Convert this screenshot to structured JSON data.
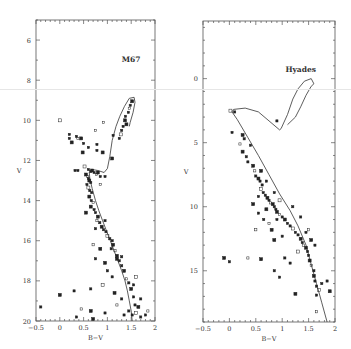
{
  "figure": {
    "panels": [
      "M67",
      "Hyades"
    ]
  },
  "chart_data": [
    {
      "type": "scatter",
      "title": "M67",
      "xlabel": "B−V",
      "ylabel": "V",
      "xlim": [
        -0.5,
        2
      ],
      "ylim": [
        20,
        5
      ],
      "y_inverted": true,
      "grid": false,
      "legend": null,
      "frame": {
        "x0": 36,
        "x1": 155,
        "y0": 20,
        "y1": 321
      },
      "xticks": [
        -0.5,
        0,
        0.5,
        1,
        1.5,
        2
      ],
      "xtick_labels": [
        "−0.5",
        "0",
        "0.5",
        "1",
        "1.5",
        "2"
      ],
      "yticks": [
        6,
        8,
        10,
        12,
        14,
        16,
        18,
        20
      ],
      "ytick_labels": [
        "6",
        "8",
        "10",
        "12",
        "14",
        "16",
        "18",
        "20"
      ],
      "annotation": {
        "text": "M67",
        "x": 1.5,
        "y": 7.1
      },
      "isochrone": [
        [
          1.52,
          20.0
        ],
        [
          1.5,
          19.5
        ],
        [
          1.46,
          19.0
        ],
        [
          1.42,
          18.5
        ],
        [
          1.37,
          18.0
        ],
        [
          1.3,
          17.5
        ],
        [
          1.22,
          17.0
        ],
        [
          1.14,
          16.5
        ],
        [
          1.06,
          16.0
        ],
        [
          0.98,
          15.5
        ],
        [
          0.9,
          15.0
        ],
        [
          0.82,
          14.5
        ],
        [
          0.75,
          14.0
        ],
        [
          0.68,
          13.4
        ],
        [
          0.63,
          12.9
        ],
        [
          0.62,
          12.6
        ],
        [
          0.68,
          12.45
        ],
        [
          0.8,
          12.5
        ],
        [
          0.93,
          12.6
        ],
        [
          1.0,
          12.4
        ],
        [
          1.05,
          11.8
        ],
        [
          1.1,
          11.0
        ],
        [
          1.18,
          10.3
        ],
        [
          1.26,
          9.8
        ],
        [
          1.36,
          9.3
        ],
        [
          1.46,
          8.9
        ],
        [
          1.56,
          8.85
        ],
        [
          1.58,
          9.1
        ],
        [
          1.54,
          9.6
        ],
        [
          1.48,
          10.1
        ],
        [
          1.46,
          10.3
        ]
      ],
      "points": [
        [
          0.0,
          10.0
        ],
        [
          0.2,
          10.7
        ],
        [
          0.2,
          10.9
        ],
        [
          0.25,
          11.1
        ],
        [
          0.35,
          10.8
        ],
        [
          0.38,
          10.9
        ],
        [
          0.45,
          10.9
        ],
        [
          0.5,
          11.15
        ],
        [
          0.6,
          11.35
        ],
        [
          0.48,
          11.6
        ],
        [
          0.75,
          10.5
        ],
        [
          0.78,
          11.2
        ],
        [
          0.9,
          11.6
        ],
        [
          1.12,
          10.75
        ],
        [
          1.25,
          10.9
        ],
        [
          1.28,
          10.7
        ],
        [
          1.3,
          10.5
        ],
        [
          1.33,
          10.3
        ],
        [
          1.4,
          10.2
        ],
        [
          1.44,
          9.6
        ],
        [
          1.46,
          9.4
        ],
        [
          1.52,
          9.05
        ],
        [
          1.48,
          9.25
        ],
        [
          1.38,
          9.8
        ],
        [
          1.37,
          10.0
        ],
        [
          0.92,
          10.1
        ],
        [
          0.78,
          11.5
        ],
        [
          1.1,
          11.9
        ],
        [
          0.32,
          12.5
        ],
        [
          0.38,
          12.5
        ],
        [
          0.52,
          12.3
        ],
        [
          0.6,
          12.45
        ],
        [
          0.65,
          12.55
        ],
        [
          0.68,
          12.5
        ],
        [
          0.72,
          12.6
        ],
        [
          0.77,
          12.7
        ],
        [
          0.8,
          12.6
        ],
        [
          0.85,
          12.8
        ],
        [
          0.95,
          12.8
        ],
        [
          0.55,
          12.7
        ],
        [
          0.58,
          12.8
        ],
        [
          0.6,
          12.9
        ],
        [
          0.62,
          13.0
        ],
        [
          0.65,
          13.1
        ],
        [
          0.57,
          13.2
        ],
        [
          0.6,
          13.35
        ],
        [
          0.63,
          13.5
        ],
        [
          0.67,
          13.6
        ],
        [
          0.62,
          13.8
        ],
        [
          0.66,
          14.0
        ],
        [
          0.7,
          14.1
        ],
        [
          0.65,
          14.3
        ],
        [
          0.72,
          14.45
        ],
        [
          0.75,
          14.6
        ],
        [
          0.8,
          14.8
        ],
        [
          0.78,
          15.0
        ],
        [
          0.84,
          15.1
        ],
        [
          0.88,
          15.3
        ],
        [
          0.92,
          15.45
        ],
        [
          0.97,
          15.55
        ],
        [
          1.0,
          15.75
        ],
        [
          1.05,
          15.9
        ],
        [
          1.1,
          16.0
        ],
        [
          1.12,
          16.2
        ],
        [
          1.08,
          16.4
        ],
        [
          1.16,
          16.5
        ],
        [
          1.2,
          16.75
        ],
        [
          1.25,
          17.0
        ],
        [
          1.3,
          17.25
        ],
        [
          1.35,
          17.5
        ],
        [
          1.4,
          17.9
        ],
        [
          1.45,
          18.1
        ],
        [
          1.5,
          18.4
        ],
        [
          1.55,
          18.8
        ],
        [
          1.58,
          19.2
        ],
        [
          1.6,
          19.6
        ],
        [
          1.52,
          19.7
        ],
        [
          1.45,
          19.5
        ],
        [
          1.65,
          19.3
        ],
        [
          1.8,
          19.7
        ],
        [
          1.85,
          19.5
        ],
        [
          0.55,
          14.6
        ],
        [
          0.75,
          15.4
        ],
        [
          0.95,
          15.0
        ],
        [
          0.85,
          16.4
        ],
        [
          0.7,
          16.2
        ],
        [
          0.75,
          16.9
        ],
        [
          0.95,
          17.1
        ],
        [
          1.0,
          17.5
        ],
        [
          1.1,
          17.8
        ],
        [
          0.9,
          18.2
        ],
        [
          0.65,
          18.4
        ],
        [
          0.3,
          18.5
        ],
        [
          0.0,
          18.7
        ],
        [
          -0.4,
          19.3
        ],
        [
          0.45,
          19.4
        ],
        [
          0.65,
          19.5
        ],
        [
          0.95,
          19.6
        ],
        [
          0.35,
          19.8
        ],
        [
          0.7,
          19.9
        ],
        [
          1.2,
          19.2
        ],
        [
          1.3,
          18.9
        ],
        [
          1.15,
          18.6
        ],
        [
          1.35,
          19.7
        ],
        [
          1.7,
          19.8
        ],
        [
          1.6,
          17.8
        ],
        [
          1.55,
          18.2
        ],
        [
          1.7,
          18.9
        ],
        [
          1.2,
          16.9
        ],
        [
          1.3,
          16.8
        ],
        [
          0.85,
          13.2
        ]
      ]
    },
    {
      "type": "scatter",
      "title": "Hyades",
      "xlabel": "B−V",
      "ylabel": "V",
      "xlim": [
        -0.5,
        2
      ],
      "ylim": [
        19,
        -4.5
      ],
      "y_inverted": true,
      "grid": false,
      "legend": null,
      "frame": {
        "x0": 203,
        "x1": 335,
        "y0": 21,
        "y1": 322
      },
      "xticks": [
        -0.5,
        0,
        0.5,
        1,
        1.5,
        2
      ],
      "xtick_labels": [
        "−0.5",
        "0",
        "0.5",
        "1",
        "1.5",
        "2"
      ],
      "yticks": [
        0,
        5,
        10,
        15
      ],
      "ytick_labels": [
        "0",
        "5",
        "10",
        "15"
      ],
      "annotation": {
        "text": "Hyades",
        "x": 1.35,
        "y": -0.5
      },
      "isochrone": [
        [
          1.85,
          19.0
        ],
        [
          1.75,
          17.5
        ],
        [
          1.65,
          16.0
        ],
        [
          1.55,
          14.5
        ],
        [
          1.45,
          13.0
        ],
        [
          1.3,
          11.5
        ],
        [
          1.15,
          10.3
        ],
        [
          0.95,
          9.0
        ],
        [
          0.75,
          7.5
        ],
        [
          0.55,
          6.0
        ],
        [
          0.35,
          4.6
        ],
        [
          0.15,
          3.2
        ],
        [
          0.05,
          2.6
        ],
        [
          0.08,
          2.4
        ],
        [
          0.3,
          2.3
        ],
        [
          0.55,
          2.6
        ],
        [
          0.75,
          3.3
        ],
        [
          0.95,
          4.0
        ],
        [
          0.98,
          3.9
        ],
        [
          1.1,
          2.8
        ],
        [
          1.2,
          1.6
        ],
        [
          1.3,
          0.8
        ],
        [
          1.42,
          0.2
        ],
        [
          1.55,
          0.0
        ],
        [
          1.6,
          0.4
        ],
        [
          1.55,
          0.6
        ],
        [
          1.45,
          1.3
        ],
        [
          1.35,
          2.2
        ],
        [
          1.25,
          3.0
        ],
        [
          1.1,
          3.6
        ]
      ],
      "points": [
        [
          0.02,
          2.5
        ],
        [
          0.1,
          2.6
        ],
        [
          0.05,
          4.2
        ],
        [
          0.25,
          4.4
        ],
        [
          0.28,
          4.7
        ],
        [
          0.2,
          5.1
        ],
        [
          0.25,
          5.7
        ],
        [
          0.32,
          6.1
        ],
        [
          0.35,
          6.5
        ],
        [
          0.45,
          6.8
        ],
        [
          0.48,
          7.2
        ],
        [
          0.5,
          7.6
        ],
        [
          0.55,
          7.8
        ],
        [
          0.58,
          8.0
        ],
        [
          0.62,
          8.3
        ],
        [
          0.6,
          8.6
        ],
        [
          0.64,
          8.9
        ],
        [
          0.68,
          9.1
        ],
        [
          0.72,
          9.3
        ],
        [
          0.75,
          9.5
        ],
        [
          0.78,
          9.7
        ],
        [
          0.82,
          9.8
        ],
        [
          0.85,
          10.0
        ],
        [
          0.88,
          10.2
        ],
        [
          0.9,
          10.4
        ],
        [
          0.95,
          10.6
        ],
        [
          1.0,
          10.8
        ],
        [
          1.05,
          11.0
        ],
        [
          1.1,
          11.3
        ],
        [
          1.15,
          11.5
        ],
        [
          1.2,
          11.7
        ],
        [
          1.25,
          12.0
        ],
        [
          1.3,
          12.2
        ],
        [
          1.35,
          12.5
        ],
        [
          1.38,
          12.8
        ],
        [
          1.4,
          13.0
        ],
        [
          1.45,
          13.2
        ],
        [
          1.48,
          13.5
        ],
        [
          1.5,
          13.8
        ],
        [
          1.52,
          14.2
        ],
        [
          1.55,
          14.6
        ],
        [
          1.6,
          15.0
        ],
        [
          1.6,
          15.4
        ],
        [
          1.62,
          15.8
        ],
        [
          1.65,
          16.2
        ],
        [
          1.7,
          16.5
        ],
        [
          1.65,
          16.9
        ],
        [
          1.85,
          15.8
        ],
        [
          1.9,
          16.6
        ],
        [
          1.75,
          16.0
        ],
        [
          1.65,
          18.2
        ],
        [
          1.25,
          16.8
        ],
        [
          0.95,
          15.5
        ],
        [
          0.85,
          15.0
        ],
        [
          0.6,
          14.1
        ],
        [
          0.35,
          14.0
        ],
        [
          0.0,
          14.3
        ],
        [
          -0.1,
          14.0
        ],
        [
          1.05,
          14.0
        ],
        [
          1.15,
          14.4
        ],
        [
          1.3,
          13.5
        ],
        [
          1.62,
          13.0
        ],
        [
          0.55,
          9.2
        ],
        [
          0.7,
          10.2
        ],
        [
          0.65,
          11.0
        ],
        [
          0.5,
          11.8
        ],
        [
          0.8,
          11.8
        ],
        [
          0.9,
          11.0
        ],
        [
          1.0,
          12.3
        ],
        [
          0.85,
          12.6
        ],
        [
          0.75,
          11.3
        ],
        [
          0.55,
          10.5
        ],
        [
          0.45,
          9.8
        ],
        [
          1.35,
          10.8
        ],
        [
          1.2,
          10.0
        ],
        [
          0.95,
          9.5
        ],
        [
          0.85,
          8.9
        ],
        [
          0.7,
          8.0
        ],
        [
          0.6,
          7.2
        ],
        [
          1.45,
          12.0
        ],
        [
          1.5,
          11.8
        ],
        [
          1.55,
          12.6
        ],
        [
          0.9,
          3.3
        ],
        [
          0.4,
          5.2
        ]
      ]
    }
  ]
}
